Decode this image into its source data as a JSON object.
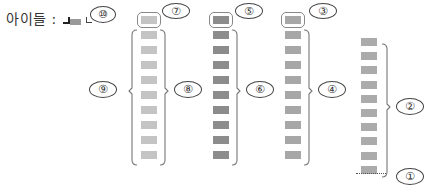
{
  "title": "아이들 :",
  "legend_icon": {
    "name": "corner-bar-icon",
    "color_dark": "#222222",
    "color_bar": "#9a9a9a"
  },
  "callouts": {
    "c1": "①",
    "c2": "②",
    "c3": "③",
    "c4": "④",
    "c5": "⑤",
    "c6": "⑥",
    "c7": "⑦",
    "c8": "⑧",
    "c9": "⑨",
    "c10": "⑩"
  },
  "columns": [
    {
      "name": "column-1",
      "x": 141,
      "count": 10,
      "color": "#c4c4c4",
      "highlight_top": true
    },
    {
      "name": "column-2",
      "x": 213,
      "count": 10,
      "color": "#8c8c8c",
      "highlight_top": true
    },
    {
      "name": "column-3",
      "x": 285,
      "count": 10,
      "color": "#a7a7a7",
      "highlight_top": true
    },
    {
      "name": "column-4",
      "x": 361,
      "count": 10,
      "color": "#ababab",
      "highlight_top": false
    }
  ]
}
